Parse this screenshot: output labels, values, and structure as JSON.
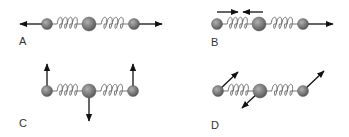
{
  "colors": {
    "ball_light": "#b0b0b0",
    "ball_dark": "#5a5a5a",
    "spring": "#666666",
    "arrow": "#111111",
    "label": "#333333"
  },
  "panels": [
    {
      "label": "A",
      "description": "Symmetric stretch: outer atoms move outward along the axis",
      "atoms": [
        {
          "x": 47,
          "y": 24,
          "r": 5.5
        },
        {
          "x": 89,
          "y": 24,
          "r": 7
        },
        {
          "x": 134,
          "y": 24,
          "r": 5.5
        }
      ],
      "arrows": [
        {
          "from": [
            42,
            24
          ],
          "to": [
            20,
            24
          ]
        },
        {
          "from": [
            139,
            24
          ],
          "to": [
            162,
            24
          ]
        }
      ],
      "label_pos": [
        19,
        36
      ]
    },
    {
      "label": "B",
      "description": "Asymmetric stretch: arrows above show compression, right atom moves outward",
      "atoms": [
        {
          "x": 217,
          "y": 24,
          "r": 5.5
        },
        {
          "x": 259,
          "y": 24,
          "r": 7
        },
        {
          "x": 303,
          "y": 24,
          "r": 5.5
        }
      ],
      "arrows": [
        {
          "from": [
            217,
            12
          ],
          "to": [
            238,
            12
          ]
        },
        {
          "from": [
            263,
            12
          ],
          "to": [
            243,
            12
          ]
        },
        {
          "from": [
            308,
            24
          ],
          "to": [
            333,
            24
          ]
        }
      ],
      "label_pos": [
        211,
        37
      ]
    },
    {
      "label": "C",
      "description": "Bending mode: outer atoms move up, central atom moves down",
      "atoms": [
        {
          "x": 47,
          "y": 91,
          "r": 5.5
        },
        {
          "x": 89,
          "y": 91,
          "r": 7
        },
        {
          "x": 133,
          "y": 91,
          "r": 5.5
        }
      ],
      "arrows": [
        {
          "from": [
            47,
            86
          ],
          "to": [
            47,
            64
          ]
        },
        {
          "from": [
            133,
            86
          ],
          "to": [
            133,
            64
          ]
        },
        {
          "from": [
            89,
            98
          ],
          "to": [
            89,
            121
          ]
        }
      ],
      "label_pos": [
        19,
        118
      ]
    },
    {
      "label": "D",
      "description": "Combined mode: atoms displaced diagonally",
      "atoms": [
        {
          "x": 218,
          "y": 91,
          "r": 5.5
        },
        {
          "x": 260,
          "y": 91,
          "r": 7
        },
        {
          "x": 303,
          "y": 91,
          "r": 5.5
        }
      ],
      "arrows": [
        {
          "from": [
            218,
            91
          ],
          "to": [
            238,
            72
          ]
        },
        {
          "from": [
            260,
            91
          ],
          "to": [
            242,
            108
          ]
        },
        {
          "from": [
            303,
            91
          ],
          "to": [
            324,
            71
          ]
        }
      ],
      "label_pos": [
        211,
        120
      ]
    }
  ]
}
